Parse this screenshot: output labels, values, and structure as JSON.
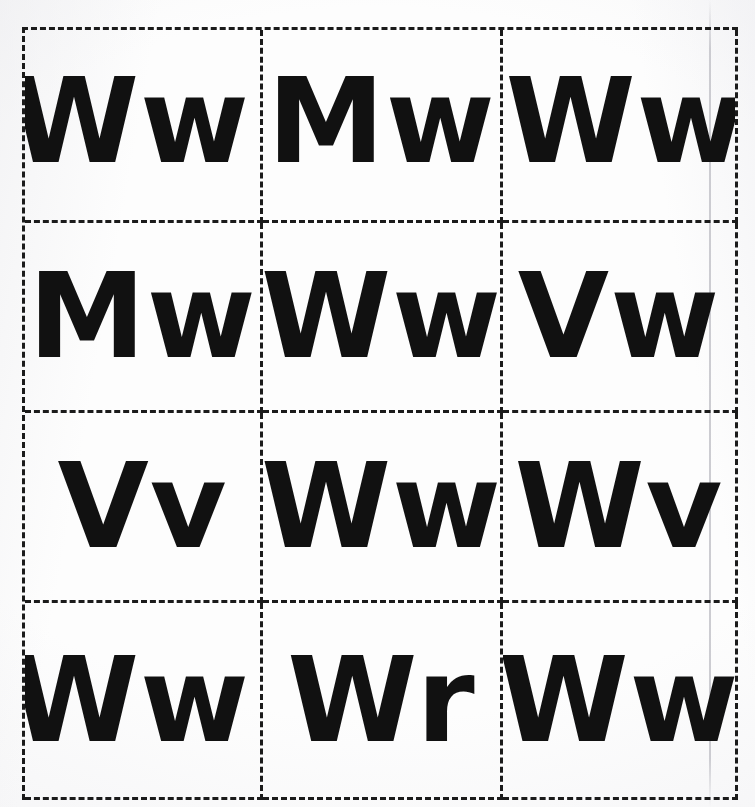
{
  "document": {
    "kind": "scanned-worksheet",
    "title": "Letter pair grid worksheet",
    "background_color": "#fdfdfd",
    "ink_color": "#111111",
    "border_color": "#1b1b1b",
    "border_style": "dashed",
    "columns": 3,
    "rows": 4
  },
  "grid": {
    "cells": [
      {
        "id": "r1c1",
        "text": "Ww",
        "uppercase": "W",
        "lowercase": "w",
        "row": 1,
        "col": 1,
        "align": "shift-left"
      },
      {
        "id": "r1c2",
        "text": "Mw",
        "uppercase": "M",
        "lowercase": "w",
        "row": 1,
        "col": 2,
        "align": "shift-center"
      },
      {
        "id": "r1c3",
        "text": "Ww",
        "uppercase": "W",
        "lowercase": "w",
        "row": 1,
        "col": 3,
        "align": "shift-right"
      },
      {
        "id": "r2c1",
        "text": "Mw",
        "uppercase": "M",
        "lowercase": "w",
        "row": 2,
        "col": 1,
        "align": "shift-center"
      },
      {
        "id": "r2c2",
        "text": "Ww",
        "uppercase": "W",
        "lowercase": "w",
        "row": 2,
        "col": 2,
        "align": "shift-center"
      },
      {
        "id": "r2c3",
        "text": "Vw",
        "uppercase": "V",
        "lowercase": "w",
        "row": 2,
        "col": 3,
        "align": "shift-center"
      },
      {
        "id": "r3c1",
        "text": "Vv",
        "uppercase": "V",
        "lowercase": "v",
        "row": 3,
        "col": 1,
        "align": "shift-center"
      },
      {
        "id": "r3c2",
        "text": "Ww",
        "uppercase": "W",
        "lowercase": "w",
        "row": 3,
        "col": 2,
        "align": "shift-center"
      },
      {
        "id": "r3c3",
        "text": "Wv",
        "uppercase": "W",
        "lowercase": "v",
        "row": 3,
        "col": 3,
        "align": "shift-center"
      },
      {
        "id": "r4c1",
        "text": "Ww",
        "uppercase": "W",
        "lowercase": "w",
        "row": 4,
        "col": 1,
        "align": "shift-left"
      },
      {
        "id": "r4c2",
        "text": "Wr",
        "uppercase": "W",
        "lowercase": "r",
        "row": 4,
        "col": 2,
        "align": "shift-center"
      },
      {
        "id": "r4c3",
        "text": "Ww",
        "uppercase": "W",
        "lowercase": "w",
        "row": 4,
        "col": 3,
        "align": "shift-center"
      }
    ]
  }
}
